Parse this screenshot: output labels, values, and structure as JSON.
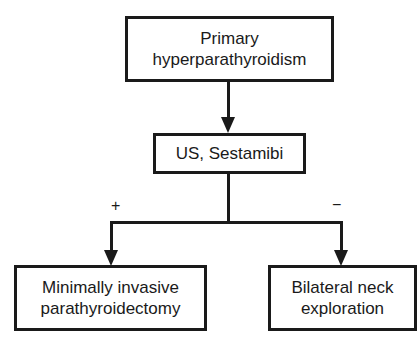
{
  "diagram": {
    "type": "flowchart",
    "nodes": [
      {
        "id": "primary",
        "lines": [
          "Primary",
          "hyperparathyroidism"
        ]
      },
      {
        "id": "imaging",
        "lines": [
          "US, Sestamibi"
        ]
      },
      {
        "id": "mip",
        "lines": [
          "Minimally invasive",
          "parathyroidectomy"
        ]
      },
      {
        "id": "bne",
        "lines": [
          "Bilateral neck",
          "exploration"
        ]
      }
    ],
    "edges": [
      {
        "from": "primary",
        "to": "imaging",
        "label": ""
      },
      {
        "from": "imaging",
        "to": "mip",
        "label": "+"
      },
      {
        "from": "imaging",
        "to": "bne",
        "label": "−"
      }
    ],
    "colors": {
      "stroke": "#1a1a1a",
      "background": "#ffffff"
    }
  }
}
